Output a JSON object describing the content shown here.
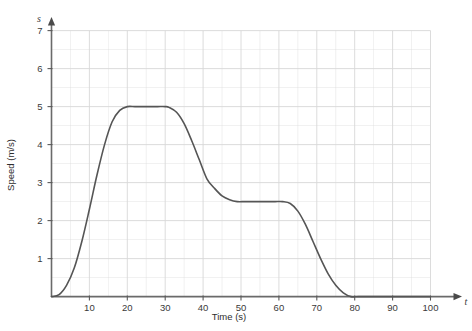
{
  "chart_data": {
    "type": "line",
    "title": "",
    "xlabel": "Time (s)",
    "ylabel": "Speed (m/s)",
    "x_axis_symbol": "t",
    "y_axis_symbol": "s",
    "xlim": [
      0,
      100
    ],
    "ylim": [
      0,
      7.4
    ],
    "x_ticks": [
      10,
      20,
      30,
      40,
      50,
      60,
      70,
      80,
      90,
      100
    ],
    "y_ticks": [
      1,
      2,
      3,
      4,
      5,
      6,
      7
    ],
    "x_tick_labels": [
      "10",
      "20",
      "30",
      "40",
      "50",
      "60",
      "70",
      "80",
      "90",
      "100"
    ],
    "y_tick_labels": [
      "1",
      "2",
      "3",
      "4",
      "5",
      "6",
      "7"
    ],
    "grid": true,
    "grid_minor_step_x": 5,
    "grid_minor_step_y": 0.5,
    "grid_color": "#d8d8d8",
    "legend": "none",
    "series": [
      {
        "name": "Speed",
        "color": "#555555",
        "line_width": 1.6,
        "x": [
          0,
          2,
          4,
          6,
          8,
          10,
          12,
          14,
          16,
          18,
          20,
          22,
          24,
          26,
          28,
          30,
          31,
          33,
          35,
          37,
          39,
          41,
          43,
          45,
          47,
          49,
          51,
          53,
          55,
          57,
          59,
          61,
          63,
          65,
          67,
          69,
          71,
          73,
          75,
          77,
          79,
          81,
          85,
          90,
          95,
          100
        ],
        "y": [
          0,
          0.05,
          0.3,
          0.75,
          1.45,
          2.3,
          3.2,
          4.0,
          4.6,
          4.9,
          5.0,
          5.0,
          5.0,
          5.0,
          5.0,
          5.0,
          4.98,
          4.85,
          4.55,
          4.1,
          3.6,
          3.1,
          2.85,
          2.65,
          2.55,
          2.5,
          2.5,
          2.5,
          2.5,
          2.5,
          2.5,
          2.5,
          2.45,
          2.25,
          1.9,
          1.45,
          1.0,
          0.6,
          0.3,
          0.1,
          0.0,
          0.0,
          0.0,
          0.0,
          0.0,
          0.0
        ]
      }
    ],
    "annotations": [
      {
        "label": "acceleration-phase",
        "x_range": [
          0,
          20
        ],
        "description": "speed rises from 0 to 5 m/s"
      },
      {
        "label": "constant-speed-5",
        "x_range": [
          20,
          31
        ],
        "description": "steady 5 m/s"
      },
      {
        "label": "deceleration-to-2.5",
        "x_range": [
          31,
          49
        ],
        "description": "speed falls from 5 to 2.5 m/s"
      },
      {
        "label": "constant-speed-2.5",
        "x_range": [
          49,
          61
        ],
        "description": "steady 2.5 m/s"
      },
      {
        "label": "deceleration-to-0",
        "x_range": [
          61,
          79
        ],
        "description": "speed falls from 2.5 to 0 m/s"
      }
    ]
  }
}
